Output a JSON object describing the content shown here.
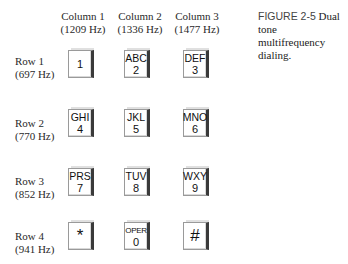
{
  "caption": {
    "figure_label": "FIGURE 2-5",
    "text_line1": "Dual tone",
    "text_line2": "multifrequency dialing."
  },
  "columns": [
    {
      "label": "Column 1",
      "freq": "(1209 Hz)"
    },
    {
      "label": "Column 2",
      "freq": "(1336 Hz)"
    },
    {
      "label": "Column 3",
      "freq": "(1477 Hz)"
    }
  ],
  "rows": [
    {
      "label": "Row 1",
      "freq": "(697 Hz)",
      "keys": [
        {
          "letters": "",
          "digit": "1"
        },
        {
          "letters": "ABC",
          "digit": "2"
        },
        {
          "letters": "DEF",
          "digit": "3"
        }
      ]
    },
    {
      "label": "Row 2",
      "freq": "(770 Hz)",
      "keys": [
        {
          "letters": "GHI",
          "digit": "4"
        },
        {
          "letters": "JKL",
          "digit": "5"
        },
        {
          "letters": "MNO",
          "digit": "6"
        }
      ]
    },
    {
      "label": "Row 3",
      "freq": "(852 Hz)",
      "keys": [
        {
          "letters": "PRS",
          "digit": "7"
        },
        {
          "letters": "TUV",
          "digit": "8"
        },
        {
          "letters": "WXY",
          "digit": "9"
        }
      ]
    },
    {
      "label": "Row 4",
      "freq": "(941 Hz)",
      "keys": [
        {
          "letters": "",
          "digit": "*"
        },
        {
          "letters": "OPER",
          "digit": "0"
        },
        {
          "letters": "",
          "digit": "#"
        }
      ]
    }
  ]
}
